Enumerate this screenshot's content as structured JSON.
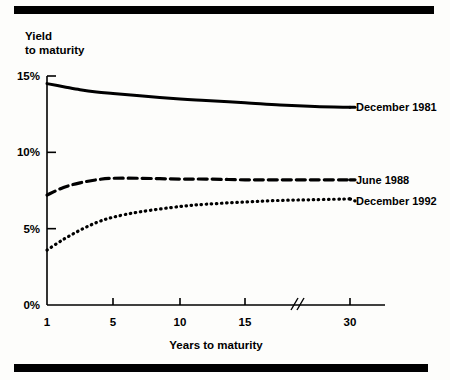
{
  "figure": {
    "top_rule": "top-rule",
    "bottom_rule": "bottom-rule"
  },
  "chart_data": {
    "type": "line",
    "title": "",
    "subtitle": "",
    "ylabel_line1": "Yield",
    "ylabel_line2": "to maturity",
    "xlabel": "Years to maturity",
    "x": [
      1,
      5,
      10,
      15,
      30
    ],
    "xtick_labels": [
      "1",
      "5",
      "10",
      "15",
      "30"
    ],
    "ytick_labels": [
      "0%",
      "5%",
      "10%",
      "15%"
    ],
    "ytick_values": [
      0,
      5,
      10,
      15
    ],
    "ylim": [
      0,
      15
    ],
    "grid": false,
    "axis_break": {
      "label": "//",
      "between": [
        15,
        30
      ],
      "note": "axis break between 15 and 30 years"
    },
    "legend_position": "right-of-curve-ends",
    "series": [
      {
        "name": "December 1981",
        "style": "solid",
        "x": [
          1,
          2,
          3,
          4,
          5,
          7,
          10,
          12,
          15,
          20,
          25,
          30
        ],
        "values": [
          14.5,
          14.3,
          14.1,
          13.95,
          13.85,
          13.7,
          13.5,
          13.4,
          13.25,
          13.1,
          13.0,
          12.95
        ]
      },
      {
        "name": "June 1988",
        "style": "dashed",
        "x": [
          1,
          2,
          3,
          4,
          5,
          7,
          10,
          12,
          15,
          20,
          25,
          30
        ],
        "values": [
          7.2,
          7.7,
          8.0,
          8.2,
          8.3,
          8.3,
          8.25,
          8.25,
          8.2,
          8.2,
          8.2,
          8.2
        ]
      },
      {
        "name": "December 1992",
        "style": "dotted",
        "x": [
          1,
          2,
          3,
          4,
          5,
          7,
          10,
          12,
          15,
          20,
          25,
          30
        ],
        "values": [
          3.6,
          4.3,
          4.9,
          5.4,
          5.75,
          6.1,
          6.45,
          6.6,
          6.75,
          6.85,
          6.9,
          6.95
        ]
      }
    ]
  }
}
